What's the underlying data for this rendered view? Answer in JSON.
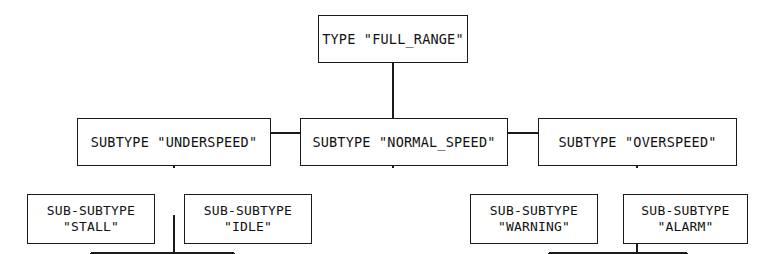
{
  "diagram": {
    "kind": "tree-hierarchy",
    "line_color": "#1a1a1a",
    "background_color": "#ffffff",
    "levels": [
      {
        "level": 1,
        "label": "type",
        "nodes": [
          {
            "id": "full-range",
            "keyword": "TYPE",
            "value": "\"FULL_RANGE\"",
            "text": "TYPE \"FULL_RANGE\"",
            "children": [
              "underspeed",
              "normal-speed",
              "overspeed"
            ]
          }
        ]
      },
      {
        "level": 2,
        "label": "subtype",
        "nodes": [
          {
            "id": "underspeed",
            "keyword": "SUBTYPE",
            "value": "\"UNDERSPEED\"",
            "text": "SUBTYPE \"UNDERSPEED\"",
            "children": [
              "stall",
              "idle"
            ]
          },
          {
            "id": "normal-speed",
            "keyword": "SUBTYPE",
            "value": "\"NORMAL_SPEED\"",
            "text": "SUBTYPE \"NORMAL_SPEED\"",
            "children": []
          },
          {
            "id": "overspeed",
            "keyword": "SUBTYPE",
            "value": "\"OVERSPEED\"",
            "text": "SUBTYPE \"OVERSPEED\"",
            "children": [
              "warning",
              "alarm"
            ]
          }
        ]
      },
      {
        "level": 3,
        "label": "sub-subtype",
        "nodes": [
          {
            "id": "stall",
            "keyword": "SUB-SUBTYPE",
            "value": "\"STALL\"",
            "children": []
          },
          {
            "id": "idle",
            "keyword": "SUB-SUBTYPE",
            "value": "\"IDLE\"",
            "children": []
          },
          {
            "id": "warning",
            "keyword": "SUB-SUBTYPE",
            "value": "\"WARNING\"",
            "children": []
          },
          {
            "id": "alarm",
            "keyword": "SUB-SUBTYPE",
            "value": "\"ALARM\"",
            "children": []
          }
        ]
      }
    ]
  }
}
